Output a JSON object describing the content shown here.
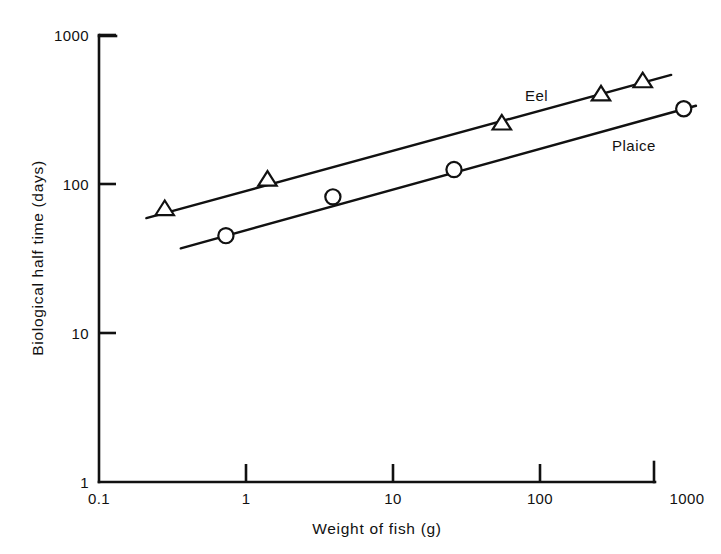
{
  "chart_data": {
    "type": "scatter",
    "title": "",
    "xlabel": "Weight of fish (g)",
    "ylabel": "Biological half time (days)",
    "xscale": "log",
    "yscale": "log",
    "xlim": [
      0.1,
      1000
    ],
    "ylim": [
      1,
      1000
    ],
    "grid": false,
    "legend_position": "inline-right",
    "xticks": [
      {
        "value": 0.1,
        "label": "0.1"
      },
      {
        "value": 1,
        "label": "1"
      },
      {
        "value": 10,
        "label": "10"
      },
      {
        "value": 100,
        "label": "100"
      },
      {
        "value": 1000,
        "label": "1000"
      }
    ],
    "yticks": [
      {
        "value": 1,
        "label": "1"
      },
      {
        "value": 10,
        "label": "10"
      },
      {
        "value": 100,
        "label": "100"
      },
      {
        "value": 1000,
        "label": "1000"
      }
    ],
    "series": [
      {
        "name": "Eel",
        "marker": "open-triangle",
        "label_text": "Eel",
        "points": [
          {
            "x": 0.28,
            "y": 68
          },
          {
            "x": 1.4,
            "y": 107
          },
          {
            "x": 55,
            "y": 255
          },
          {
            "x": 260,
            "y": 400
          },
          {
            "x": 500,
            "y": 490
          }
        ],
        "fit_line": {
          "x1": 0.21,
          "y1": 59,
          "x2": 780,
          "y2": 540
        }
      },
      {
        "name": "Plaice",
        "marker": "open-circle",
        "label_text": "Plaice",
        "points": [
          {
            "x": 0.73,
            "y": 45
          },
          {
            "x": 3.9,
            "y": 82
          },
          {
            "x": 26,
            "y": 125
          },
          {
            "x": 950,
            "y": 320
          }
        ],
        "fit_line": {
          "x1": 0.36,
          "y1": 37,
          "x2": 1150,
          "y2": 335
        }
      }
    ]
  },
  "axes": {
    "x_title": "Weight of fish (g)",
    "y_title": "Biological half time (days)"
  },
  "labels": {
    "eel": "Eel",
    "plaice": "Plaice"
  },
  "colors": {
    "ink": "#111111",
    "background": "#ffffff"
  }
}
